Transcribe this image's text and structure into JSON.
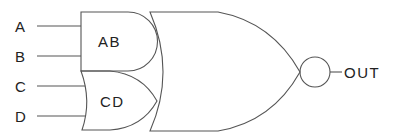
{
  "inputs": [
    {
      "label": "A",
      "y": 26
    },
    {
      "label": "B",
      "y": 56
    },
    {
      "label": "C",
      "y": 86
    },
    {
      "label": "D",
      "y": 116
    }
  ],
  "gates": {
    "and_gate": {
      "label": "AB",
      "type": "AND"
    },
    "or_gate": {
      "label": "CD",
      "type": "OR"
    },
    "nor_gate": {
      "type": "NOR"
    }
  },
  "output": {
    "label": "OUT"
  },
  "colors": {
    "stroke": "#555555",
    "text": "#222222",
    "background": "#ffffff"
  }
}
